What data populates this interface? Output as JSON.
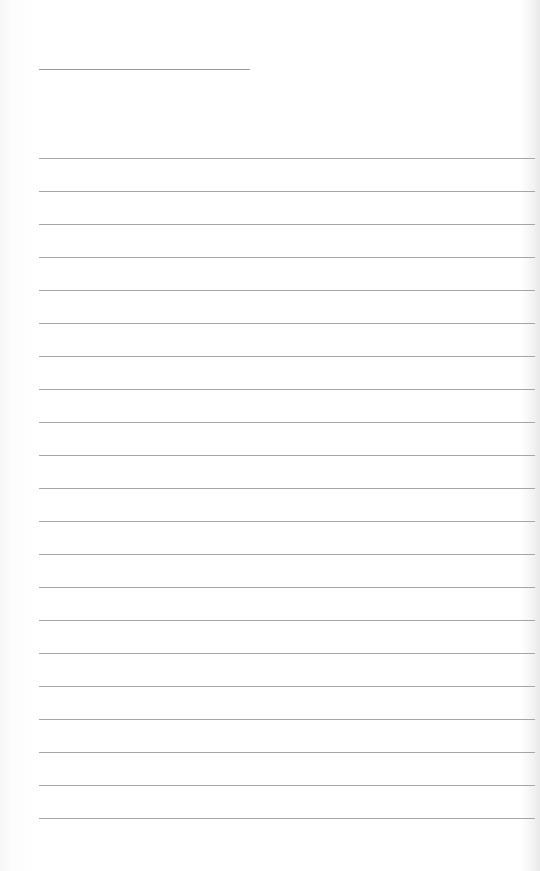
{
  "document": {
    "type": "lined-paper",
    "title_line": {
      "text": ""
    },
    "lines": [
      {
        "text": ""
      },
      {
        "text": ""
      },
      {
        "text": ""
      },
      {
        "text": ""
      },
      {
        "text": ""
      },
      {
        "text": ""
      },
      {
        "text": ""
      },
      {
        "text": ""
      },
      {
        "text": ""
      },
      {
        "text": ""
      },
      {
        "text": ""
      },
      {
        "text": ""
      },
      {
        "text": ""
      },
      {
        "text": ""
      },
      {
        "text": ""
      },
      {
        "text": ""
      },
      {
        "text": ""
      },
      {
        "text": ""
      },
      {
        "text": ""
      },
      {
        "text": ""
      },
      {
        "text": ""
      }
    ],
    "line_color": "#a6a6a6",
    "paper_color": "#ffffff"
  }
}
